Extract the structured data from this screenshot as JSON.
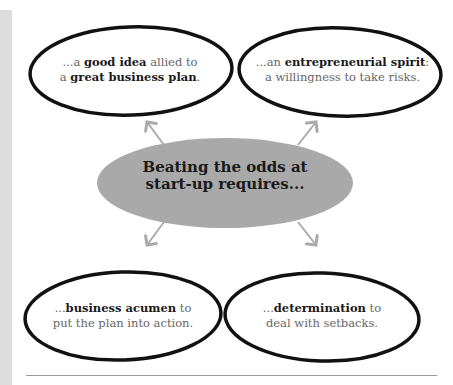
{
  "center": {
    "line1": "Beating the odds at",
    "line2": "start-up requires..."
  },
  "bubbles": [
    {
      "pre": "...a ",
      "bold1": "good idea",
      "mid": " allied to",
      "pre2": "a ",
      "bold2": "great business plan",
      "end": "."
    },
    {
      "pre": "...an ",
      "bold1": "entrepreneurial spirit",
      "mid": ":",
      "line2": "a willingness to take risks."
    },
    {
      "pre": "...",
      "bold1": "business acumen",
      "mid": " to",
      "line2": "put the plan into action."
    },
    {
      "pre": "...",
      "bold1": "determination",
      "mid": " to",
      "line2": "deal with setbacks."
    }
  ],
  "colors": {
    "center_fill": "#a9a9a9",
    "arrow": "#aaaaaa",
    "outline": "#111111",
    "side_strip": "#dcdcdc"
  }
}
